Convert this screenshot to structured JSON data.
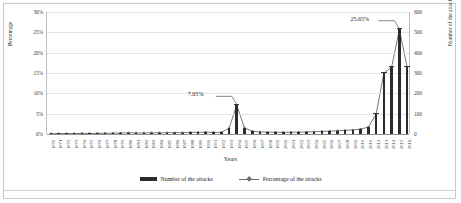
{
  "chart_data": {
    "type": "bar",
    "title": "",
    "xlabel": "Years",
    "ylabel": "Percentage",
    "y2label": "Number of the attacks",
    "ylim": [
      0,
      30
    ],
    "y2lim": [
      0,
      600
    ],
    "grid": true,
    "legend_position": "bottom",
    "yticks": [
      "0%",
      "5%",
      "10%",
      "15%",
      "20%",
      "25%",
      "30%"
    ],
    "y2ticks": [
      "0",
      "100",
      "200",
      "300",
      "400",
      "500",
      "600"
    ],
    "categories": [
      "1970",
      "1971",
      "1972",
      "1973",
      "1974",
      "1975",
      "1976",
      "1977",
      "1978",
      "1979",
      "1980",
      "1981",
      "1982",
      "1983",
      "1984",
      "1985",
      "1986",
      "1987",
      "1988",
      "1989",
      "1990",
      "1991",
      "1992",
      "1993",
      "1994",
      "1995",
      "1996",
      "1997",
      "1998",
      "1999",
      "2000",
      "2001",
      "2002",
      "2003",
      "2004",
      "2005",
      "2006",
      "2007",
      "2008",
      "2009",
      "2010",
      "2011",
      "2012",
      "2013",
      "2014",
      "2015",
      "2016"
    ],
    "series": [
      {
        "name": "Number of the attacks",
        "axis": "right",
        "type": "bar",
        "color": "#2b2b2b",
        "values": [
          2,
          2,
          2,
          2,
          3,
          3,
          3,
          4,
          4,
          5,
          6,
          5,
          5,
          6,
          6,
          6,
          7,
          7,
          8,
          8,
          9,
          8,
          8,
          28,
          142,
          30,
          14,
          10,
          9,
          9,
          8,
          9,
          9,
          10,
          11,
          13,
          14,
          16,
          18,
          20,
          24,
          34,
          98,
          300,
          330,
          515,
          330
        ]
      },
      {
        "name": "Percentage of the attacks",
        "axis": "left",
        "type": "line",
        "color": "#6a6a6a",
        "values": [
          0.1,
          0.1,
          0.1,
          0.1,
          0.15,
          0.15,
          0.15,
          0.2,
          0.2,
          0.25,
          0.3,
          0.25,
          0.25,
          0.3,
          0.3,
          0.3,
          0.35,
          0.35,
          0.4,
          0.4,
          0.45,
          0.4,
          0.4,
          1.4,
          7.05,
          1.5,
          0.7,
          0.5,
          0.45,
          0.45,
          0.4,
          0.45,
          0.45,
          0.5,
          0.55,
          0.65,
          0.7,
          0.8,
          0.9,
          1.0,
          1.2,
          1.7,
          4.9,
          14.95,
          16.45,
          25.65,
          16.45
        ]
      }
    ],
    "annotations": [
      {
        "text": "7.05%",
        "category": "1994"
      },
      {
        "text": "25.65%",
        "category": "2015"
      }
    ]
  },
  "legend": {
    "items": [
      {
        "label": "Number of the attacks"
      },
      {
        "label": "Percentage of the attacks"
      }
    ]
  }
}
